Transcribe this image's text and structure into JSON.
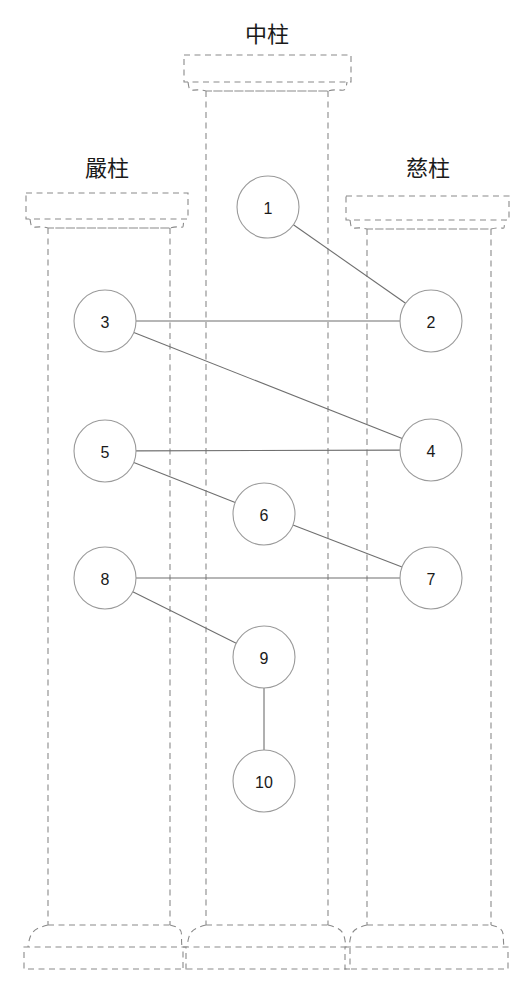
{
  "diagram": {
    "title": "",
    "type": "three-pillar-node-graph",
    "background_color": "#ffffff",
    "stroke_colors": {
      "pillar_outline": "#8a8a8a",
      "node_circle": "#9a9a9a",
      "edge_line": "#6f6f6f",
      "text": "#1a1a1a"
    },
    "pillars": [
      {
        "id": "left-pillar",
        "label": "嚴柱",
        "label_x": 107,
        "label_y": 176,
        "abacus": {
          "x": 26,
          "y": 193,
          "w": 162,
          "h": 26
        },
        "shaft": {
          "x": 48,
          "y": 236,
          "w": 122,
          "h": 689
        },
        "plinth": {
          "x": 24,
          "y": 947,
          "w": 162,
          "h": 22
        }
      },
      {
        "id": "center-pillar",
        "label": "中柱",
        "label_x": 267,
        "label_y": 42,
        "abacus": {
          "x": 184,
          "y": 55,
          "w": 167,
          "h": 27
        },
        "shaft": {
          "x": 206,
          "y": 99,
          "w": 122,
          "h": 826
        },
        "plinth": {
          "x": 183,
          "y": 947,
          "w": 167,
          "h": 22
        }
      },
      {
        "id": "right-pillar",
        "label": "慈柱",
        "label_x": 428,
        "label_y": 176,
        "abacus": {
          "x": 346,
          "y": 196,
          "w": 163,
          "h": 24
        },
        "shaft": {
          "x": 367,
          "y": 237,
          "w": 124,
          "h": 688
        },
        "plinth": {
          "x": 345,
          "y": 947,
          "w": 163,
          "h": 22
        }
      }
    ],
    "nodes": [
      {
        "id": 1,
        "label": "1",
        "cx": 268,
        "cy": 207,
        "r": 31,
        "pillar": "center-pillar"
      },
      {
        "id": 2,
        "label": "2",
        "cx": 431,
        "cy": 321,
        "r": 31,
        "pillar": "right-pillar"
      },
      {
        "id": 3,
        "label": "3",
        "cx": 105,
        "cy": 321,
        "r": 31,
        "pillar": "left-pillar"
      },
      {
        "id": 4,
        "label": "4",
        "cx": 431,
        "cy": 450,
        "r": 31,
        "pillar": "right-pillar"
      },
      {
        "id": 5,
        "label": "5",
        "cx": 105,
        "cy": 451,
        "r": 31,
        "pillar": "left-pillar"
      },
      {
        "id": 6,
        "label": "6",
        "cx": 264,
        "cy": 514,
        "r": 31,
        "pillar": "center-pillar"
      },
      {
        "id": 7,
        "label": "7",
        "cx": 431,
        "cy": 578,
        "r": 31,
        "pillar": "right-pillar"
      },
      {
        "id": 8,
        "label": "8",
        "cx": 105,
        "cy": 578,
        "r": 31,
        "pillar": "left-pillar"
      },
      {
        "id": 9,
        "label": "9",
        "cx": 264,
        "cy": 657,
        "r": 31,
        "pillar": "center-pillar"
      },
      {
        "id": 10,
        "label": "10",
        "cx": 264,
        "cy": 781,
        "r": 31,
        "pillar": "center-pillar"
      }
    ],
    "edges": [
      {
        "from": 1,
        "to": 2
      },
      {
        "from": 3,
        "to": 2
      },
      {
        "from": 3,
        "to": 4
      },
      {
        "from": 5,
        "to": 4
      },
      {
        "from": 5,
        "to": 6
      },
      {
        "from": 6,
        "to": 7
      },
      {
        "from": 8,
        "to": 7
      },
      {
        "from": 8,
        "to": 9
      },
      {
        "from": 9,
        "to": 10
      }
    ],
    "caption": {
      "text": "",
      "x": 265,
      "y": 996
    }
  }
}
